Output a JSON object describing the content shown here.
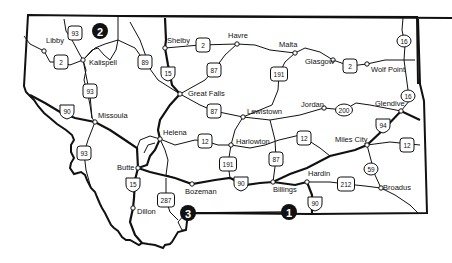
{
  "map": {
    "title": "Montana",
    "colors": {
      "ink": "#111111",
      "background": "#ffffff",
      "marker_fill": "#111111",
      "marker_text": "#ffffff"
    },
    "cities": [
      {
        "name": "Libby",
        "x": 44,
        "y": 51,
        "lx": 46,
        "ly": 43
      },
      {
        "name": "Kalispell",
        "x": 83,
        "y": 60,
        "lx": 89,
        "ly": 65
      },
      {
        "name": "Missoula",
        "x": 95,
        "y": 122,
        "lx": 98,
        "ly": 118
      },
      {
        "name": "Shelby",
        "x": 165,
        "y": 48,
        "lx": 167,
        "ly": 43
      },
      {
        "name": "Havre",
        "x": 237,
        "y": 44,
        "lx": 228,
        "ly": 38
      },
      {
        "name": "Malta",
        "x": 295,
        "y": 53,
        "lx": 279,
        "ly": 47
      },
      {
        "name": "Glasgow",
        "x": 333,
        "y": 60,
        "lx": 305,
        "ly": 64
      },
      {
        "name": "Wolf Point",
        "x": 367,
        "y": 64,
        "lx": 371,
        "ly": 72
      },
      {
        "name": "Great Falls",
        "x": 180,
        "y": 94,
        "lx": 188,
        "ly": 96
      },
      {
        "name": "Lewistown",
        "x": 243,
        "y": 117,
        "lx": 247,
        "ly": 114
      },
      {
        "name": "Jordan",
        "x": 324,
        "y": 108,
        "lx": 301,
        "ly": 107
      },
      {
        "name": "Glendive",
        "x": 401,
        "y": 111,
        "lx": 375,
        "ly": 106
      },
      {
        "name": "Helena",
        "x": 160,
        "y": 139,
        "lx": 163,
        "ly": 135
      },
      {
        "name": "Harlowton",
        "x": 231,
        "y": 145,
        "lx": 236,
        "ly": 144
      },
      {
        "name": "Miles City",
        "x": 367,
        "y": 145,
        "lx": 335,
        "ly": 142
      },
      {
        "name": "Butte",
        "x": 138,
        "y": 168,
        "lx": 117,
        "ly": 170
      },
      {
        "name": "Bozeman",
        "x": 192,
        "y": 184,
        "lx": 185,
        "ly": 194
      },
      {
        "name": "Billings",
        "x": 273,
        "y": 182,
        "lx": 273,
        "ly": 192
      },
      {
        "name": "Hardin",
        "x": 307,
        "y": 182,
        "lx": 308,
        "ly": 176
      },
      {
        "name": "Broadus",
        "x": 381,
        "y": 188,
        "lx": 383,
        "ly": 190
      },
      {
        "name": "Dillon",
        "x": 133,
        "y": 208,
        "lx": 137,
        "ly": 214
      }
    ],
    "shields": [
      {
        "label": "93",
        "type": "us",
        "x": 75,
        "y": 33
      },
      {
        "label": "2",
        "type": "us",
        "x": 61,
        "y": 62
      },
      {
        "label": "89",
        "type": "us",
        "x": 145,
        "y": 62
      },
      {
        "label": "93",
        "type": "us",
        "x": 90,
        "y": 91
      },
      {
        "label": "90",
        "type": "interstate",
        "x": 67,
        "y": 111
      },
      {
        "label": "2",
        "type": "us",
        "x": 203,
        "y": 45
      },
      {
        "label": "15",
        "type": "interstate",
        "x": 168,
        "y": 73
      },
      {
        "label": "87",
        "type": "us",
        "x": 214,
        "y": 70
      },
      {
        "label": "191",
        "type": "us",
        "x": 279,
        "y": 74
      },
      {
        "label": "87",
        "type": "us",
        "x": 214,
        "y": 111
      },
      {
        "label": "16",
        "type": "state",
        "x": 404,
        "y": 41
      },
      {
        "label": "2",
        "type": "us",
        "x": 350,
        "y": 66
      },
      {
        "label": "200",
        "type": "state",
        "x": 344,
        "y": 110
      },
      {
        "label": "16",
        "type": "state",
        "x": 408,
        "y": 96
      },
      {
        "label": "94",
        "type": "interstate",
        "x": 383,
        "y": 125
      },
      {
        "label": "12",
        "type": "us",
        "x": 407,
        "y": 145
      },
      {
        "label": "12",
        "type": "us",
        "x": 205,
        "y": 141
      },
      {
        "label": "12",
        "type": "us",
        "x": 304,
        "y": 138
      },
      {
        "label": "93",
        "type": "us",
        "x": 84,
        "y": 153
      },
      {
        "label": "191",
        "type": "us",
        "x": 228,
        "y": 164
      },
      {
        "label": "87",
        "type": "us",
        "x": 276,
        "y": 159
      },
      {
        "label": "15",
        "type": "interstate",
        "x": 133,
        "y": 184
      },
      {
        "label": "287",
        "type": "us",
        "x": 166,
        "y": 200
      },
      {
        "label": "90",
        "type": "interstate",
        "x": 241,
        "y": 183
      },
      {
        "label": "59",
        "type": "state",
        "x": 371,
        "y": 169
      },
      {
        "label": "212",
        "type": "us",
        "x": 346,
        "y": 184
      },
      {
        "label": "90",
        "type": "interstate",
        "x": 315,
        "y": 203
      }
    ],
    "markers": [
      {
        "label": "1",
        "x": 289,
        "y": 212
      },
      {
        "label": "2",
        "x": 100,
        "y": 31
      },
      {
        "label": "3",
        "x": 188,
        "y": 213
      }
    ]
  }
}
